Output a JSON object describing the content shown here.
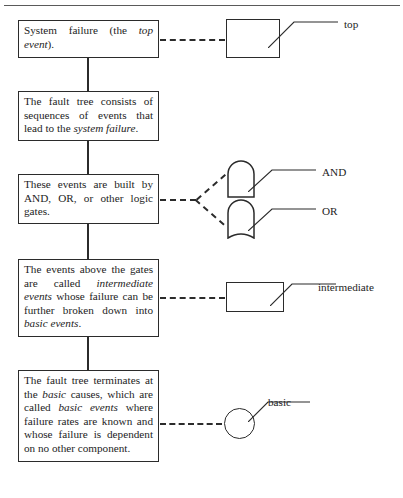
{
  "figure": {
    "type": "fault-tree-explanation-diagram",
    "top_rule": true,
    "caption": ""
  },
  "boxes": [
    {
      "id": "top",
      "text_runs": [
        {
          "t": "System failure (the ",
          "i": false
        },
        {
          "t": "top event",
          "i": true
        },
        {
          "t": ").",
          "i": false
        }
      ],
      "plain": "System failure (the top event)."
    },
    {
      "id": "consists",
      "text_runs": [
        {
          "t": "The fault tree consists of sequences of events that lead to the ",
          "i": false
        },
        {
          "t": "system failure",
          "i": true
        },
        {
          "t": ".",
          "i": false
        }
      ],
      "plain": "The fault tree consists of sequences of events that lead to the system failure."
    },
    {
      "id": "gates",
      "text_runs": [
        {
          "t": "These events are built by AND, OR, or other logic gates.",
          "i": false
        }
      ],
      "plain": "These events are built by AND, OR, or other logic gates."
    },
    {
      "id": "intermediate",
      "text_runs": [
        {
          "t": "The events above the gates are called ",
          "i": false
        },
        {
          "t": "intermediate events",
          "i": true
        },
        {
          "t": " whose failure can be further broken down into ",
          "i": false
        },
        {
          "t": "basic events",
          "i": true
        },
        {
          "t": ".",
          "i": false
        }
      ],
      "plain": "The events above the gates are called intermediate events whose failure can be further broken down into basic events."
    },
    {
      "id": "basic",
      "text_runs": [
        {
          "t": "The fault tree terminates at the ",
          "i": false
        },
        {
          "t": "basic",
          "i": true
        },
        {
          "t": " causes, which are called ",
          "i": false
        },
        {
          "t": "basic events",
          "i": true
        },
        {
          "t": " where failure rates are known and whose failure is dependent on no other component.",
          "i": false
        }
      ],
      "plain": "The fault tree terminates at the basic causes, which are called basic events where failure rates are known and whose failure is dependent on no other component."
    }
  ],
  "symbols": [
    {
      "id": "top",
      "shape": "rectangle",
      "label": "top"
    },
    {
      "id": "and",
      "shape": "and-gate",
      "label": "AND"
    },
    {
      "id": "or",
      "shape": "or-gate",
      "label": "OR"
    },
    {
      "id": "intermediate",
      "shape": "rectangle",
      "label": "intermediate"
    },
    {
      "id": "basic",
      "shape": "circle",
      "label": "basic"
    }
  ],
  "colors": {
    "stroke": "#2b2b2b",
    "text": "#1d1d1d",
    "background": "#ffffff",
    "rule": "#5a5a5a"
  }
}
